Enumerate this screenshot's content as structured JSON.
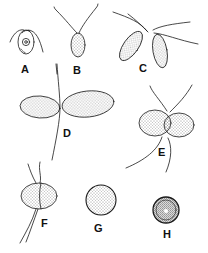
{
  "figure": {
    "panels": [
      {
        "id": "A",
        "label": "A",
        "description": "ovoid flagellate cell with central nucleus and two flagella",
        "label_x": 21,
        "label_y": 64
      },
      {
        "id": "B",
        "label": "B",
        "description": "oblong stippled cell with two long flagella",
        "label_x": 73,
        "label_y": 65
      },
      {
        "id": "C",
        "label": "C",
        "description": "pair of elongated stippled cells joined at flagellated apices",
        "label_x": 139,
        "label_y": 63
      },
      {
        "id": "D",
        "label": "D",
        "description": "two cells fused at apices forming a bilobed zygote with trailing flagella",
        "label_x": 63,
        "label_y": 128
      },
      {
        "id": "E",
        "label": "E",
        "description": "fusing cell pair with constricted middle and flagella",
        "label_x": 158,
        "label_y": 147
      },
      {
        "id": "F",
        "label": "F",
        "description": "oval zygote with median line and flagella",
        "label_x": 41,
        "label_y": 218
      },
      {
        "id": "G",
        "label": "G",
        "description": "round stippled zygote",
        "label_x": 94,
        "label_y": 223
      },
      {
        "id": "H",
        "label": "H",
        "description": "small dark thick-walled zygospore",
        "label_x": 163,
        "label_y": 229
      }
    ],
    "colors": {
      "ink": "#1a1a1a",
      "background": "#ffffff"
    }
  }
}
